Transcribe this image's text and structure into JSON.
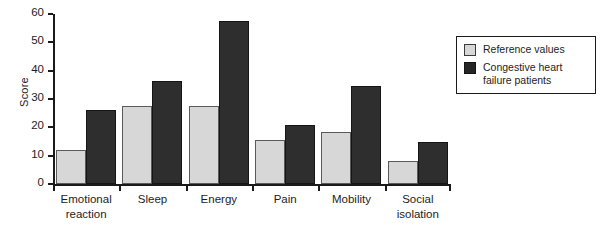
{
  "chart_data": {
    "type": "bar",
    "title": "",
    "xlabel": "",
    "ylabel": "Score",
    "ylim": [
      0,
      60
    ],
    "yticks": [
      0,
      10,
      20,
      30,
      40,
      50,
      60
    ],
    "grid": false,
    "legend_position": "right",
    "categories": [
      "Emotional\nreaction",
      "Sleep",
      "Energy",
      "Pain",
      "Mobility",
      "Social\nisolation"
    ],
    "series": [
      {
        "name": "Reference values",
        "color": "#d7d7d7",
        "values": [
          12,
          27.5,
          27.5,
          15.5,
          18.5,
          8
        ]
      },
      {
        "name": "Congestive heart\nfailure patients",
        "color": "#2e2e2e",
        "values": [
          26,
          36.5,
          57.5,
          21,
          34.5,
          15
        ]
      }
    ]
  },
  "axis": {
    "y_label": "Score",
    "y_tick_labels": [
      "0",
      "10",
      "20",
      "30",
      "40",
      "50",
      "60"
    ]
  },
  "legend": {
    "entries": [
      {
        "label": "Reference values",
        "swatch": "light-gray-square"
      },
      {
        "label": "Congestive heart\nfailure patients",
        "swatch": "dark-square"
      }
    ]
  }
}
